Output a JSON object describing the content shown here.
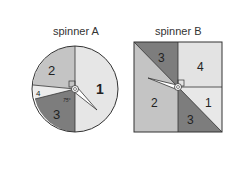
{
  "spinnerA": {
    "title": "spinner A",
    "sections": [
      {
        "label": "1",
        "color": "#e6e6e6"
      },
      {
        "label": "2",
        "color": "#c2c2c2"
      },
      {
        "label": "3",
        "color": "#7d7d7d"
      },
      {
        "label": "4",
        "color": "#ececec"
      }
    ],
    "angle_label": "75°"
  },
  "spinnerB": {
    "title": "spinner B",
    "sections": [
      {
        "label": "3",
        "color": "#7d7d7d"
      },
      {
        "label": "4",
        "color": "#e3e3e3"
      },
      {
        "label": "2",
        "color": "#c4c4c4"
      },
      {
        "label": "1",
        "color": "#e8e8e8"
      },
      {
        "label": "3",
        "color": "#7d7d7d"
      }
    ]
  }
}
